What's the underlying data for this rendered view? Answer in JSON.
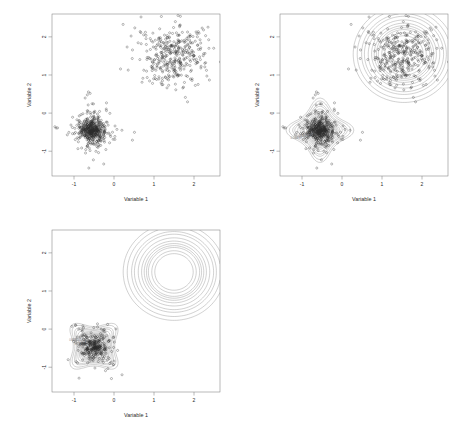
{
  "figure": {
    "background": "#ffffff",
    "panel_count": 3,
    "layout": "2x2 grid, fourth cell empty",
    "point_color": "#2a2a2a",
    "contour_color": "#8a8a8a",
    "frame_color": "#808080"
  },
  "panels": [
    {
      "id": "panel-scatter",
      "kind": "scatter",
      "position": "top-left",
      "xlabel": "Variable 1",
      "ylabel": "Variable 2",
      "xticks": [
        "-1",
        "0",
        "1",
        "2"
      ],
      "yticks": [
        "-1",
        "0",
        "1",
        "2"
      ],
      "xtick_values": [
        -1,
        0,
        1,
        2
      ],
      "ytick_values": [
        -1,
        0,
        1,
        2
      ],
      "xlim": [
        -1.55,
        2.65
      ],
      "ylim": [
        -1.65,
        2.6
      ],
      "marker": "open-circle",
      "has_contours": false
    },
    {
      "id": "panel-contour-star",
      "kind": "scatter+contour",
      "position": "top-right",
      "xlabel": "Variable 1",
      "ylabel": "Variable 2",
      "xticks": [
        "-1",
        "0",
        "1",
        "2"
      ],
      "yticks": [
        "-1",
        "0",
        "1",
        "2"
      ],
      "xtick_values": [
        -1,
        0,
        1,
        2
      ],
      "ytick_values": [
        -1,
        0,
        1,
        2
      ],
      "xlim": [
        -1.55,
        2.65
      ],
      "ylim": [
        -1.65,
        2.6
      ],
      "marker": "open-circle",
      "has_contours": true,
      "cluster_shape": "four-pointed star (axis aligned)"
    },
    {
      "id": "panel-contour-diagonal",
      "kind": "scatter+contour",
      "position": "bottom-left",
      "xlabel": "Variable 1",
      "ylabel": "Variable 2",
      "xticks": [
        "-1",
        "0",
        "1",
        "2"
      ],
      "yticks": [
        "-1",
        "0",
        "1",
        "2"
      ],
      "xtick_values": [
        -1,
        0,
        1,
        2
      ],
      "ytick_values": [
        -1,
        0,
        1,
        2
      ],
      "xlim": [
        -1.55,
        2.65
      ],
      "ylim": [
        -1.65,
        2.6
      ],
      "marker": "open-circle",
      "has_contours": true,
      "cluster_shape": "four-pointed star, elongated along the negative diagonal"
    }
  ],
  "chart_data": {
    "type": "scatter",
    "title": "",
    "xlabel": "Variable 1",
    "ylabel": "Variable 2",
    "xlim": [
      -1.55,
      2.65
    ],
    "ylim": [
      -1.65,
      2.6
    ],
    "xticks": [
      -1,
      0,
      1,
      2
    ],
    "yticks": [
      -1,
      0,
      1,
      2
    ],
    "grid": false,
    "legend": "none",
    "clusters": [
      {
        "name": "lower-left cluster",
        "center": [
          -0.55,
          -0.45
        ],
        "n_points": 500,
        "spread": [
          0.32,
          0.32
        ],
        "shape": "star / cross shaped, heavy tailed",
        "correlation": 0.0
      },
      {
        "name": "upper-right cluster",
        "center": [
          1.55,
          1.55
        ],
        "n_points": 380,
        "spread": [
          0.42,
          0.42
        ],
        "shape": "round Gaussian",
        "correlation": 0.0
      }
    ],
    "clusters_panel3": [
      {
        "name": "lower-left cluster (tilted)",
        "center": [
          -0.5,
          -0.45
        ],
        "n_points": 330,
        "spread": [
          0.3,
          0.3
        ],
        "shape": "star shaped, elongated on the negative diagonal",
        "correlation": -0.85
      },
      {
        "name": "upper-right cluster",
        "center": [
          1.5,
          1.5
        ],
        "n_points": 0,
        "spread": [
          0.42,
          0.42
        ],
        "shape": "round Gaussian (contours only)",
        "correlation": 0.0
      }
    ],
    "contour_levels": [
      0.005,
      0.01,
      0.02,
      0.03,
      0.05,
      0.075,
      0.1,
      0.125,
      0.15,
      0.2,
      0.25
    ],
    "contour_labels": [
      "0.005",
      "0.01",
      "0.02",
      "0.03",
      "0.05",
      "0.075",
      "0.1",
      "0.125",
      "0.15",
      "0.2",
      "0.25"
    ]
  }
}
